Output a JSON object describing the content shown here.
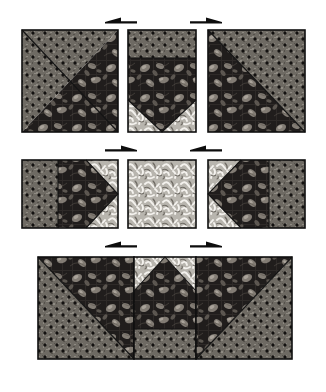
{
  "figure": {
    "canvas": {
      "width": 326,
      "height": 392
    },
    "background_color": "#ffffff"
  },
  "fabrics": [
    {
      "id": "dotted",
      "name": "dark-dotted-fabric",
      "base_color": "#6e6a63",
      "speck_color": "#9a968e",
      "dot_color": "#141210",
      "description": "medium grey tone-on-tone with regular black dots"
    },
    {
      "id": "floral",
      "name": "dark-floral-fabric",
      "base_color": "#201d1c",
      "leaf_color": "#8d8780",
      "accent_color": "#5c5852",
      "description": "very dark ground with large light roses and leaves"
    },
    {
      "id": "light",
      "name": "light-scroll-fabric",
      "base_color": "#c9c6bf",
      "scroll_color": "#f2f0ec",
      "shadow_color": "#77736c",
      "description": "light busy scrollwork print"
    }
  ],
  "rows": [
    {
      "id": "row-1",
      "label": "Top row",
      "units": [
        {
          "id": "unit-top-left",
          "name": "half-square-triangle-dotted-upper-left",
          "type": "half-square-triangle",
          "x": 22,
          "y": 30,
          "w": 96,
          "h": 102,
          "upper_left_fabric": "dotted",
          "lower_right_fabric": "floral",
          "diagonal": "tl-br"
        },
        {
          "id": "unit-top-center",
          "name": "flying-geese-point-down-unit",
          "type": "strip-and-point",
          "x": 128,
          "y": 30,
          "w": 68,
          "h": 102,
          "top_strip_fabric": "dotted",
          "top_strip_height": 28,
          "body_fabric": "floral",
          "corner_fabric": "light",
          "point_direction": "down"
        },
        {
          "id": "unit-top-right",
          "name": "half-square-triangle-dotted-upper-right",
          "type": "half-square-triangle",
          "x": 208,
          "y": 30,
          "w": 97,
          "h": 102,
          "upper_right_fabric": "dotted",
          "lower_left_fabric": "floral",
          "diagonal": "tr-bl"
        }
      ],
      "arrows": [
        {
          "id": "arrow-r1-left",
          "name": "press-arrow-left",
          "direction": "left",
          "x": 105,
          "y": 22,
          "length": 32
        },
        {
          "id": "arrow-r1-right",
          "name": "press-arrow-right",
          "direction": "right",
          "x": 190,
          "y": 22,
          "length": 32
        }
      ]
    },
    {
      "id": "row-2",
      "label": "Middle row",
      "units": [
        {
          "id": "unit-mid-left",
          "name": "side-unit-point-right",
          "type": "strip-and-point",
          "x": 22,
          "y": 160,
          "w": 96,
          "h": 68,
          "left_strip_fabric": "dotted",
          "left_strip_width": 36,
          "body_fabric": "floral",
          "corner_fabric": "light",
          "point_direction": "right"
        },
        {
          "id": "unit-mid-center",
          "name": "center-square-light",
          "type": "plain-square",
          "x": 128,
          "y": 160,
          "w": 68,
          "h": 68,
          "fabric": "light"
        },
        {
          "id": "unit-mid-right",
          "name": "side-unit-point-left",
          "type": "strip-and-point",
          "x": 208,
          "y": 160,
          "w": 97,
          "h": 68,
          "right_strip_fabric": "dotted",
          "right_strip_width": 36,
          "body_fabric": "floral",
          "corner_fabric": "light",
          "point_direction": "left"
        }
      ],
      "arrows": [
        {
          "id": "arrow-r2-left",
          "name": "press-arrow-right",
          "direction": "right",
          "x": 105,
          "y": 150,
          "length": 32
        },
        {
          "id": "arrow-r2-right",
          "name": "press-arrow-left",
          "direction": "left",
          "x": 190,
          "y": 150,
          "length": 32
        }
      ]
    },
    {
      "id": "row-3",
      "label": "Bottom row",
      "units": [
        {
          "id": "unit-bot-left",
          "name": "half-square-triangle-dotted-lower-left",
          "type": "half-square-triangle",
          "x": 38,
          "y": 257,
          "w": 96,
          "h": 102,
          "lower_left_fabric": "dotted",
          "upper_right_fabric": "floral",
          "diagonal": "tl-br"
        },
        {
          "id": "unit-bot-center",
          "name": "flying-geese-point-up-unit",
          "type": "strip-and-point",
          "x": 134,
          "y": 257,
          "w": 62,
          "h": 102,
          "bottom_strip_fabric": "dotted",
          "bottom_strip_height": 30,
          "body_fabric": "floral",
          "corner_fabric": "light",
          "point_direction": "up"
        },
        {
          "id": "unit-bot-right",
          "name": "half-square-triangle-dotted-lower-right",
          "type": "half-square-triangle",
          "x": 196,
          "y": 257,
          "w": 96,
          "h": 102,
          "lower_right_fabric": "dotted",
          "upper_left_fabric": "floral",
          "diagonal": "tr-bl"
        }
      ],
      "arrows": [
        {
          "id": "arrow-r3-left",
          "name": "press-arrow-left",
          "direction": "left",
          "x": 105,
          "y": 246,
          "length": 32
        },
        {
          "id": "arrow-r3-right",
          "name": "press-arrow-right",
          "direction": "right",
          "x": 190,
          "y": 246,
          "length": 32
        }
      ]
    }
  ]
}
